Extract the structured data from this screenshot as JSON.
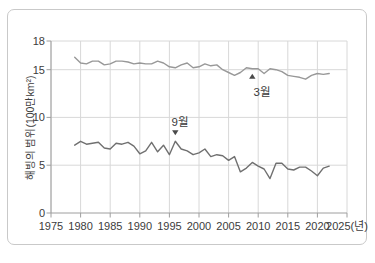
{
  "chart_data": {
    "type": "line",
    "title": "",
    "ylabel": "해빙의 범위(100만km²)",
    "xlabel": "",
    "x_unit_suffix": "(년)",
    "xlim": [
      1975,
      2025
    ],
    "ylim": [
      0,
      18
    ],
    "x_ticks": [
      1975,
      1980,
      1985,
      1990,
      1995,
      2000,
      2005,
      2010,
      2015,
      2020,
      2025
    ],
    "y_ticks": [
      0,
      5,
      10,
      15,
      18
    ],
    "grid": true,
    "legend_position": "none",
    "years": [
      1979,
      1980,
      1981,
      1982,
      1983,
      1984,
      1985,
      1986,
      1987,
      1988,
      1989,
      1990,
      1991,
      1992,
      1993,
      1994,
      1995,
      1996,
      1997,
      1998,
      1999,
      2000,
      2001,
      2002,
      2003,
      2004,
      2005,
      2006,
      2007,
      2008,
      2009,
      2010,
      2011,
      2012,
      2013,
      2014,
      2015,
      2016,
      2017,
      2018,
      2019,
      2020,
      2021,
      2022
    ],
    "series": [
      {
        "id": "march",
        "name": "3월",
        "color": "#989898",
        "values": [
          16.3,
          15.7,
          15.6,
          15.9,
          15.9,
          15.5,
          15.6,
          15.9,
          15.9,
          15.8,
          15.6,
          15.7,
          15.6,
          15.6,
          15.9,
          15.7,
          15.3,
          15.2,
          15.5,
          15.7,
          15.2,
          15.3,
          15.6,
          15.4,
          15.5,
          15.0,
          14.7,
          14.4,
          14.7,
          15.2,
          15.1,
          15.1,
          14.6,
          15.1,
          15.0,
          14.8,
          14.4,
          14.3,
          14.2,
          14.0,
          14.4,
          14.6,
          14.5,
          14.6
        ]
      },
      {
        "id": "september",
        "name": "9월",
        "color": "#707070",
        "values": [
          7.1,
          7.5,
          7.2,
          7.3,
          7.4,
          6.8,
          6.7,
          7.3,
          7.2,
          7.4,
          7.0,
          6.2,
          6.5,
          7.4,
          6.4,
          7.1,
          6.1,
          7.5,
          6.7,
          6.5,
          6.1,
          6.3,
          6.7,
          5.9,
          6.1,
          6.0,
          5.5,
          5.9,
          4.3,
          4.7,
          5.3,
          4.9,
          4.6,
          3.6,
          5.2,
          5.2,
          4.6,
          4.5,
          4.8,
          4.8,
          4.4,
          3.9,
          4.7,
          4.9
        ]
      }
    ],
    "annotations": [
      {
        "id": "march",
        "text": "3월",
        "series": "march",
        "year": 2009,
        "side": "below",
        "dx": 10
      },
      {
        "id": "september",
        "text": "9월",
        "series": "september",
        "year": 1996,
        "side": "above",
        "dx": 5
      }
    ],
    "colors": {
      "grid": "#d8d8d8",
      "axis": "#9e9e9e",
      "text": "#3c3c3c",
      "annotation": "#4a4a4a",
      "card_border": "#c9c9c9",
      "background": "#ffffff"
    }
  }
}
